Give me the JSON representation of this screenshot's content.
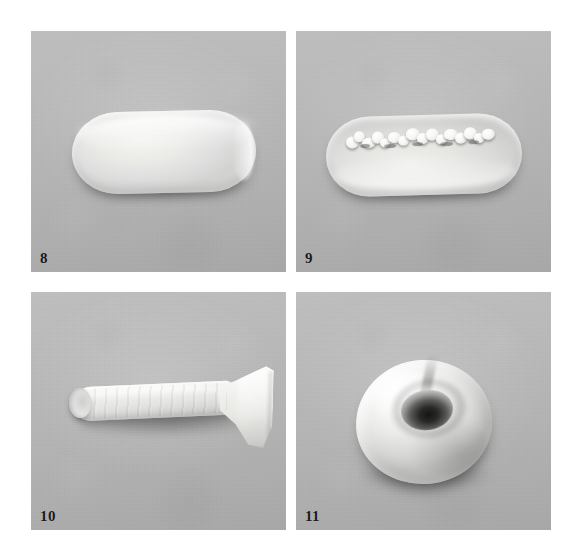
{
  "plate": {
    "title": "Specimen photographic plate",
    "layout": "2x2 grid of photographic panels",
    "background_color": "#ffffff",
    "panel_background_color": "#b6b6b6",
    "specimen_color": "#ededea",
    "label_color": "#1a1a1a",
    "width": 587,
    "height": 560
  },
  "panels": [
    {
      "label": "8",
      "position": "top-left",
      "specimen_shape": "elongated rounded slab, smooth surface",
      "description": "Smooth elongated oblong specimen with rounded ends, uniform pale surface, lit from upper left",
      "x": 31,
      "y": 31,
      "w": 255,
      "h": 241
    },
    {
      "label": "9",
      "position": "top-right",
      "specimen_shape": "elongated rounded slab with granular crystalline crest",
      "description": "Elongated oblong specimen of similar outline bearing a rough granular crystalline crest running along its upper median axis",
      "x": 296,
      "y": 31,
      "w": 255,
      "h": 241
    },
    {
      "label": "10",
      "position": "bottom-left",
      "specimen_shape": "tubular rod flaring into a trumpet-like terminal",
      "description": "Elongated tubular specimen with longitudinal ridges, narrow rounded left terminal and a broad flaring splayed right terminal",
      "x": 31,
      "y": 292,
      "w": 255,
      "h": 238
    },
    {
      "label": "11",
      "position": "bottom-right",
      "specimen_shape": "toroidal body with deep central cavity",
      "description": "Rounded donut-like specimen viewed obliquely from above, showing a deep dark central aperture and a radial crease at the upper rim",
      "x": 296,
      "y": 292,
      "w": 255,
      "h": 238
    }
  ]
}
